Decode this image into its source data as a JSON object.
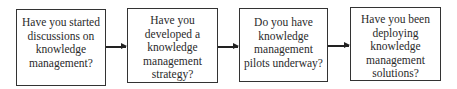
{
  "diagram": {
    "type": "flowchart",
    "direction": "left-to-right",
    "steps": [
      {
        "label": "Have you started\ndiscussions on\nknowledge\nmanagement?"
      },
      {
        "label": "Have you\ndeveloped a\nknowledge\nmanagement\nstrategy?"
      },
      {
        "label": "Do you have\nknowledge\nmanagement\npilots underway?"
      },
      {
        "label": "Have you been\ndeploying\nknowledge\nmanagement\nsolutions?"
      }
    ],
    "connectors": [
      {
        "from": 0,
        "to": 1
      },
      {
        "from": 1,
        "to": 2
      },
      {
        "from": 2,
        "to": 3
      }
    ]
  }
}
